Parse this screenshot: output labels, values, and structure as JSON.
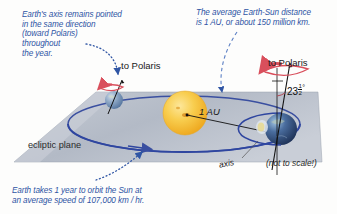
{
  "diagram": {
    "annotations": {
      "axis_note": "Earth's axis remains pointed in the same direction (toward Polaris) throughout the year.",
      "au_note": "The average Earth-Sun distance is 1 AU, or about 150 million km.",
      "year_note": "Earth takes 1 year to orbit the Sun at an average speed of 107,000 km / hr."
    },
    "axis_note_lines": [
      "Earth's axis remains pointed",
      "in the same direction",
      "(toward Polaris)",
      "throughout",
      "the year."
    ],
    "au_note_lines": [
      "The average Earth-Sun distance",
      "is 1 AU, or about 150 million km."
    ],
    "year_note_lines": [
      "Earth takes 1 year to orbit the Sun at",
      "an average speed of 107,000 km / hr."
    ],
    "labels": {
      "polaris_left": "to Polaris",
      "polaris_right": "to Polaris",
      "ecliptic_plane": "ecliptic plane",
      "distance": "1 AU",
      "axis": "axis",
      "not_to_scale": "(not to scale!)",
      "tilt_whole": "23",
      "tilt_num": "1",
      "tilt_den": "2",
      "tilt_degree": "°"
    },
    "objects": {
      "sun_name": "sun-sphere",
      "earth_left_name": "earth-sphere-left",
      "earth_right_name": "earth-sphere-right",
      "orbit_name": "orbit-ellipse",
      "plane_name": "ecliptic-plane"
    },
    "colors": {
      "annotation_blue": "#2f55a4",
      "orbit_blue": "#3a4fa0",
      "plane_gray": "#b9bfc9",
      "sun_yellow": "#f5c030",
      "sun_core": "#f0a81e",
      "earth_blue": "#3d5a86",
      "rotation_red": "#d94f5c",
      "text_black": "#1a1a1a"
    }
  }
}
